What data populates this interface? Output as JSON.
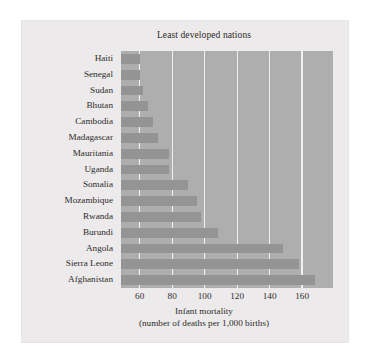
{
  "chart_data": {
    "type": "bar",
    "orientation": "horizontal",
    "title": "Least developed nations",
    "xlabel_line1": "Infant mortality",
    "xlabel_line2": "(number of deaths per 1,000 births)",
    "ylabel": "",
    "xlim": [
      48.5,
      179
    ],
    "xticks": [
      60,
      80,
      100,
      120,
      140,
      160
    ],
    "xticklabels": [
      "60",
      "80",
      "100",
      "120",
      "140",
      "160"
    ],
    "grid": "vertical",
    "legend": "none",
    "bar_color": "#949494",
    "plot_background": "#aeaeae",
    "gridline_color": "#f1f0ef",
    "categories": [
      "Haiti",
      "Senegal",
      "Sudan",
      "Bhutan",
      "Cambodia",
      "Madagascar",
      "Mauritania",
      "Uganda",
      "Somalia",
      "Mozambique",
      "Rwanda",
      "Burundi",
      "Angola",
      "Sierra Leone",
      "Afghanistan"
    ],
    "values": [
      60,
      60,
      62,
      65,
      68,
      71,
      78,
      78,
      90,
      95,
      98,
      108,
      148,
      158,
      168
    ]
  },
  "figure": {
    "title": "Least developed nations",
    "caption": ""
  }
}
